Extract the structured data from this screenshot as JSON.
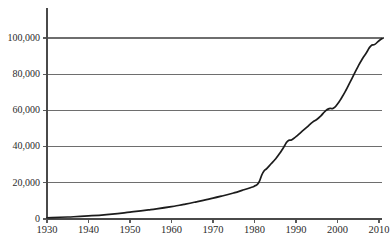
{
  "chart_data": {
    "type": "line",
    "title": "",
    "subtitle": "",
    "xlabel": "",
    "ylabel": "",
    "xlim": [
      1930,
      2011
    ],
    "ylim": [
      0,
      100000
    ],
    "grid": true,
    "legend": null,
    "legend_position": "none",
    "xticks": [
      1930,
      1940,
      1950,
      1960,
      1970,
      1980,
      1990,
      2000,
      2010
    ],
    "xtick_labels": [
      "1930",
      "1940",
      "1950",
      "1960",
      "1970",
      "1980",
      "1990",
      "2000",
      "2010"
    ],
    "yticks": [
      0,
      20000,
      40000,
      60000,
      80000,
      100000
    ],
    "ytick_labels": [
      "0",
      "20,000",
      "40,000",
      "60,000",
      "80,000",
      "100,000"
    ],
    "series": [
      {
        "name": "cumulative-total",
        "color": "#1c1c1c",
        "x": [
          1930,
          1935,
          1940,
          1945,
          1950,
          1955,
          1960,
          1963,
          1966,
          1969,
          1972,
          1975,
          1977,
          1979,
          1980,
          1981,
          1982,
          1983,
          1984,
          1985,
          1986,
          1987,
          1988,
          1989,
          1990,
          1991,
          1992,
          1993,
          1994,
          1995,
          1996,
          1997,
          1998,
          1999,
          2000,
          2001,
          2002,
          2003,
          2004,
          2005,
          2006,
          2007,
          2008,
          2009,
          2010,
          2011
        ],
        "y": [
          700,
          1100,
          1700,
          2600,
          3800,
          5200,
          6800,
          8100,
          9500,
          11000,
          12600,
          14400,
          15800,
          17300,
          18200,
          20000,
          25500,
          28000,
          30500,
          33000,
          36000,
          39500,
          43000,
          43800,
          45500,
          47500,
          49500,
          51500,
          53500,
          55000,
          57000,
          59500,
          61000,
          61200,
          63500,
          67000,
          71000,
          75500,
          80000,
          84500,
          88500,
          92000,
          95500,
          96500,
          98500,
          100000
        ]
      }
    ],
    "annotations": []
  },
  "axes": {
    "y_axis_name": "y-axis",
    "x_axis_name": "x-axis"
  },
  "colors": {
    "curve": "#1c1c1c",
    "gridline": "#6e6e6e",
    "spine": "#4a4a4a",
    "text": "#2b2b2b",
    "background": "#ffffff"
  }
}
